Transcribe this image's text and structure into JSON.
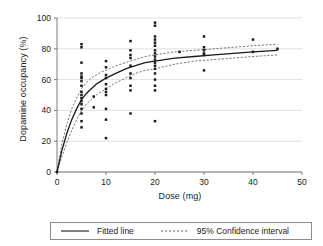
{
  "chart_data": {
    "type": "scatter",
    "title": "",
    "xlabel": "Dose (mg)",
    "ylabel": "Dopamine occupancy (%)",
    "xlim": [
      0,
      50
    ],
    "ylim": [
      0,
      100
    ],
    "xticks": [
      0,
      10,
      20,
      30,
      40,
      50
    ],
    "yticks": [
      0,
      20,
      40,
      60,
      80,
      100
    ],
    "grid": "horizontal",
    "legend_position": "below-plot",
    "point_color": "#1a1a1a",
    "line_color": "#1a1a1a",
    "ci_color": "#555555",
    "scatter_points": [
      {
        "x": 0,
        "y": 0
      },
      {
        "x": 5,
        "y": 83
      },
      {
        "x": 5,
        "y": 81
      },
      {
        "x": 5,
        "y": 71
      },
      {
        "x": 5,
        "y": 64
      },
      {
        "x": 5,
        "y": 62
      },
      {
        "x": 5,
        "y": 61
      },
      {
        "x": 5,
        "y": 59
      },
      {
        "x": 5,
        "y": 56
      },
      {
        "x": 5,
        "y": 52
      },
      {
        "x": 5,
        "y": 50
      },
      {
        "x": 5,
        "y": 48
      },
      {
        "x": 5,
        "y": 46
      },
      {
        "x": 5,
        "y": 44
      },
      {
        "x": 5,
        "y": 41
      },
      {
        "x": 5,
        "y": 38
      },
      {
        "x": 5,
        "y": 33
      },
      {
        "x": 5,
        "y": 29
      },
      {
        "x": 7.5,
        "y": 49
      },
      {
        "x": 7.5,
        "y": 42
      },
      {
        "x": 10,
        "y": 72
      },
      {
        "x": 10,
        "y": 68
      },
      {
        "x": 10,
        "y": 63
      },
      {
        "x": 10,
        "y": 61
      },
      {
        "x": 10,
        "y": 57
      },
      {
        "x": 10,
        "y": 54
      },
      {
        "x": 10,
        "y": 52
      },
      {
        "x": 10,
        "y": 50
      },
      {
        "x": 10,
        "y": 41
      },
      {
        "x": 10,
        "y": 34
      },
      {
        "x": 10,
        "y": 22
      },
      {
        "x": 15,
        "y": 85
      },
      {
        "x": 15,
        "y": 79
      },
      {
        "x": 15,
        "y": 76
      },
      {
        "x": 15,
        "y": 74
      },
      {
        "x": 15,
        "y": 69
      },
      {
        "x": 15,
        "y": 64
      },
      {
        "x": 15,
        "y": 61
      },
      {
        "x": 15,
        "y": 56
      },
      {
        "x": 15,
        "y": 53
      },
      {
        "x": 15,
        "y": 38
      },
      {
        "x": 20,
        "y": 97
      },
      {
        "x": 20,
        "y": 95
      },
      {
        "x": 20,
        "y": 88
      },
      {
        "x": 20,
        "y": 86
      },
      {
        "x": 20,
        "y": 84
      },
      {
        "x": 20,
        "y": 82
      },
      {
        "x": 20,
        "y": 79
      },
      {
        "x": 20,
        "y": 77
      },
      {
        "x": 20,
        "y": 75
      },
      {
        "x": 20,
        "y": 73
      },
      {
        "x": 20,
        "y": 71
      },
      {
        "x": 20,
        "y": 69
      },
      {
        "x": 20,
        "y": 67
      },
      {
        "x": 20,
        "y": 64
      },
      {
        "x": 20,
        "y": 60
      },
      {
        "x": 20,
        "y": 56
      },
      {
        "x": 20,
        "y": 53
      },
      {
        "x": 20,
        "y": 33
      },
      {
        "x": 25,
        "y": 78
      },
      {
        "x": 30,
        "y": 88
      },
      {
        "x": 30,
        "y": 81
      },
      {
        "x": 30,
        "y": 79
      },
      {
        "x": 30,
        "y": 77
      },
      {
        "x": 30,
        "y": 76
      },
      {
        "x": 30,
        "y": 66
      },
      {
        "x": 40,
        "y": 86
      },
      {
        "x": 40,
        "y": 78
      },
      {
        "x": 45,
        "y": 80
      }
    ],
    "fitted_line": {
      "name": "Fitted line",
      "style": "solid",
      "points": [
        {
          "x": 0,
          "y": 0
        },
        {
          "x": 1,
          "y": 14
        },
        {
          "x": 2,
          "y": 25
        },
        {
          "x": 3,
          "y": 34
        },
        {
          "x": 4,
          "y": 41
        },
        {
          "x": 5,
          "y": 47
        },
        {
          "x": 6,
          "y": 51
        },
        {
          "x": 7,
          "y": 54
        },
        {
          "x": 8,
          "y": 57
        },
        {
          "x": 9,
          "y": 59
        },
        {
          "x": 10,
          "y": 61
        },
        {
          "x": 12,
          "y": 64
        },
        {
          "x": 14,
          "y": 67
        },
        {
          "x": 16,
          "y": 69
        },
        {
          "x": 18,
          "y": 71
        },
        {
          "x": 20,
          "y": 72
        },
        {
          "x": 24,
          "y": 74
        },
        {
          "x": 28,
          "y": 75
        },
        {
          "x": 32,
          "y": 76
        },
        {
          "x": 36,
          "y": 77
        },
        {
          "x": 40,
          "y": 78
        },
        {
          "x": 45,
          "y": 79
        }
      ]
    },
    "confidence_interval": {
      "name": "95% Confidence interval",
      "style": "dashed",
      "level": "95%",
      "upper": [
        {
          "x": 0,
          "y": 0
        },
        {
          "x": 1,
          "y": 18
        },
        {
          "x": 2,
          "y": 31
        },
        {
          "x": 3,
          "y": 41
        },
        {
          "x": 4,
          "y": 48
        },
        {
          "x": 5,
          "y": 54
        },
        {
          "x": 6,
          "y": 58
        },
        {
          "x": 7,
          "y": 61
        },
        {
          "x": 8,
          "y": 63
        },
        {
          "x": 9,
          "y": 65
        },
        {
          "x": 10,
          "y": 66
        },
        {
          "x": 12,
          "y": 69
        },
        {
          "x": 14,
          "y": 71
        },
        {
          "x": 16,
          "y": 73
        },
        {
          "x": 18,
          "y": 75
        },
        {
          "x": 20,
          "y": 76
        },
        {
          "x": 24,
          "y": 78
        },
        {
          "x": 28,
          "y": 79
        },
        {
          "x": 32,
          "y": 80
        },
        {
          "x": 36,
          "y": 81
        },
        {
          "x": 40,
          "y": 82
        },
        {
          "x": 45,
          "y": 83
        }
      ],
      "lower": [
        {
          "x": 0,
          "y": 0
        },
        {
          "x": 1,
          "y": 10
        },
        {
          "x": 2,
          "y": 19
        },
        {
          "x": 3,
          "y": 27
        },
        {
          "x": 4,
          "y": 34
        },
        {
          "x": 5,
          "y": 40
        },
        {
          "x": 6,
          "y": 44
        },
        {
          "x": 7,
          "y": 47
        },
        {
          "x": 8,
          "y": 50
        },
        {
          "x": 9,
          "y": 52
        },
        {
          "x": 10,
          "y": 54
        },
        {
          "x": 12,
          "y": 58
        },
        {
          "x": 14,
          "y": 61
        },
        {
          "x": 16,
          "y": 64
        },
        {
          "x": 18,
          "y": 66
        },
        {
          "x": 20,
          "y": 67
        },
        {
          "x": 24,
          "y": 70
        },
        {
          "x": 28,
          "y": 72
        },
        {
          "x": 32,
          "y": 73
        },
        {
          "x": 36,
          "y": 74
        },
        {
          "x": 40,
          "y": 75
        },
        {
          "x": 45,
          "y": 76
        }
      ]
    }
  },
  "legend": {
    "items": [
      {
        "label": "Fitted line",
        "style": "solid"
      },
      {
        "label": "95% Confidence interval",
        "style": "dashed"
      }
    ]
  }
}
